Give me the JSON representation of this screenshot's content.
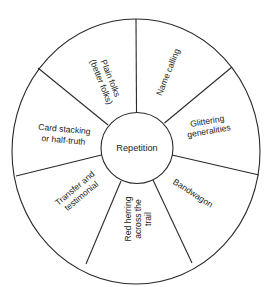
{
  "diagram": {
    "type": "wheel",
    "center": {
      "label": "Repetition"
    },
    "segments": [
      {
        "id": "name-calling",
        "lines": [
          "Name calling"
        ]
      },
      {
        "id": "glittering-generalities",
        "lines": [
          "Glittering",
          "generalities"
        ]
      },
      {
        "id": "bandwagon",
        "lines": [
          "Bandwagon"
        ]
      },
      {
        "id": "red-herring",
        "lines": [
          "Red herring",
          "across the",
          "trail"
        ]
      },
      {
        "id": "transfer-testimonial",
        "lines": [
          "Transfer and",
          "testimonial"
        ]
      },
      {
        "id": "card-stacking",
        "lines": [
          "Card stacking",
          "or half-truth"
        ]
      },
      {
        "id": "plain-folks",
        "lines": [
          "Plain folks",
          "(better folks)"
        ]
      }
    ],
    "colors": {
      "line": "#2a2a2a",
      "text": "#222222",
      "background": "#ffffff"
    }
  }
}
